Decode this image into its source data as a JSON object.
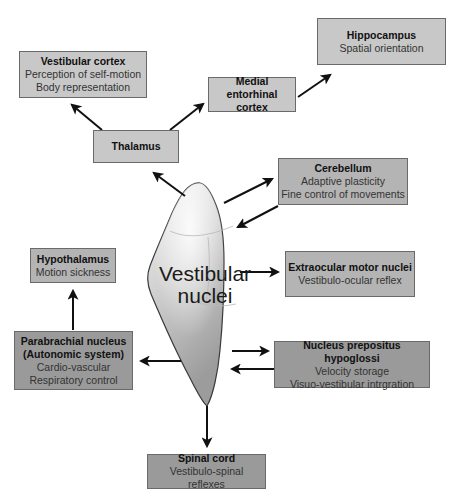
{
  "diagram": {
    "center": {
      "line1": "Vestibular",
      "line2": "nuclei"
    },
    "nodes": {
      "vestibular_cortex": {
        "title": "Vestibular cortex",
        "lines": [
          "Perception of self-motion",
          "Body representation"
        ]
      },
      "thalamus": {
        "title": "Thalamus",
        "lines": []
      },
      "medial_entorhinal_cortex": {
        "title_line1": "Medial entorhinal",
        "title_line2": "cortex"
      },
      "hippocampus": {
        "title": "Hippocampus",
        "lines": [
          "Spatial orientation"
        ]
      },
      "cerebellum": {
        "title": "Cerebellum",
        "lines": [
          "Adaptive plasticity",
          "Fine control of movements"
        ]
      },
      "extraocular_motor_nuclei": {
        "title": "Extraocular motor nuclei",
        "lines": [
          "Vestibulo-ocular reflex"
        ]
      },
      "nucleus_prepositus_hypoglossi": {
        "title": "Nucleus prepositus hypoglossi",
        "lines": [
          "Velocity storage",
          "Visuo-vestibular intrgration"
        ]
      },
      "hypothalamus": {
        "title": "Hypothalamus",
        "lines": [
          "Motion sickness"
        ]
      },
      "parabrachial_nucleus": {
        "title_line1": "Parabrachial nucleus",
        "title_line2": "(Autonomic system)",
        "lines": [
          "Cardio-vascular",
          "Respiratory control"
        ]
      },
      "spinal_cord": {
        "title": "Spinal cord",
        "lines": [
          "Vestibulo-spinal reflexes"
        ]
      }
    },
    "connections": [
      {
        "from": "Vestibular nuclei",
        "to": "Thalamus",
        "direction": "one-way"
      },
      {
        "from": "Thalamus",
        "to": "Vestibular cortex",
        "direction": "one-way"
      },
      {
        "from": "Thalamus",
        "to": "Medial entorhinal cortex",
        "direction": "one-way"
      },
      {
        "from": "Medial entorhinal cortex",
        "to": "Hippocampus",
        "direction": "one-way"
      },
      {
        "from": "Vestibular nuclei",
        "to": "Cerebellum",
        "direction": "one-way"
      },
      {
        "from": "Cerebellum",
        "to": "Vestibular nuclei",
        "direction": "one-way"
      },
      {
        "from": "Vestibular nuclei",
        "to": "Extraocular motor nuclei",
        "direction": "one-way"
      },
      {
        "from": "Vestibular nuclei",
        "to": "Nucleus prepositus hypoglossi",
        "direction": "one-way"
      },
      {
        "from": "Nucleus prepositus hypoglossi",
        "to": "Vestibular nuclei",
        "direction": "one-way"
      },
      {
        "from": "Vestibular nuclei",
        "to": "Parabrachial nucleus",
        "direction": "one-way"
      },
      {
        "from": "Parabrachial nucleus",
        "to": "Hypothalamus",
        "direction": "one-way"
      },
      {
        "from": "Vestibular nuclei",
        "to": "Spinal cord",
        "direction": "one-way"
      }
    ],
    "colors": {
      "box_light": "#c8c8c8",
      "box_mid": "#b4b4b4",
      "box_dark": "#9a9a9a",
      "arrow": "#111111",
      "border": "#6a6a6a"
    }
  }
}
